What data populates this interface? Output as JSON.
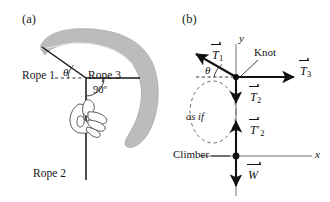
{
  "figure": {
    "width": 330,
    "height": 202,
    "background": "#ffffff",
    "ink_color": "#141414",
    "cliff_fill": "#b8b8b8",
    "axis_color": "#6e6e6e"
  },
  "panels": [
    {
      "id": "a",
      "label": "(a)",
      "caption_labels": {
        "rope1": "Rope 1",
        "rope3": "Rope 3",
        "rope2": "Rope 2",
        "angle": "θ",
        "right_angle": "90º"
      },
      "objects": {
        "cliff_name": "overhanging-cliff",
        "hand_name": "climber-hand-gripping-rope",
        "knot_name": "rope-junction-knot",
        "dashed_horizontal_name": "horizontal-reference-dashed-line"
      }
    },
    {
      "id": "b",
      "label": "(b)",
      "axes": {
        "x_label": "x",
        "y_label": "y"
      },
      "point_labels": {
        "knot": "Knot",
        "climber": "Climber",
        "as_if": "as if",
        "angle": "θ"
      },
      "vectors": [
        {
          "name": "tension-1",
          "symbol": "T",
          "subscript": "1",
          "prime": false,
          "direction": "up-left",
          "label_text": "T1"
        },
        {
          "name": "tension-3",
          "symbol": "T",
          "subscript": "3",
          "prime": false,
          "direction": "right",
          "label_text": "T3"
        },
        {
          "name": "tension-2",
          "symbol": "T",
          "subscript": "2",
          "prime": false,
          "direction": "down",
          "label_text": "T2"
        },
        {
          "name": "tension-2-prime",
          "symbol": "T",
          "subscript": "2",
          "prime": true,
          "direction": "up",
          "label_text": "T2'"
        },
        {
          "name": "weight",
          "symbol": "W",
          "subscript": "",
          "prime": false,
          "direction": "down",
          "label_text": "W"
        }
      ]
    }
  ]
}
